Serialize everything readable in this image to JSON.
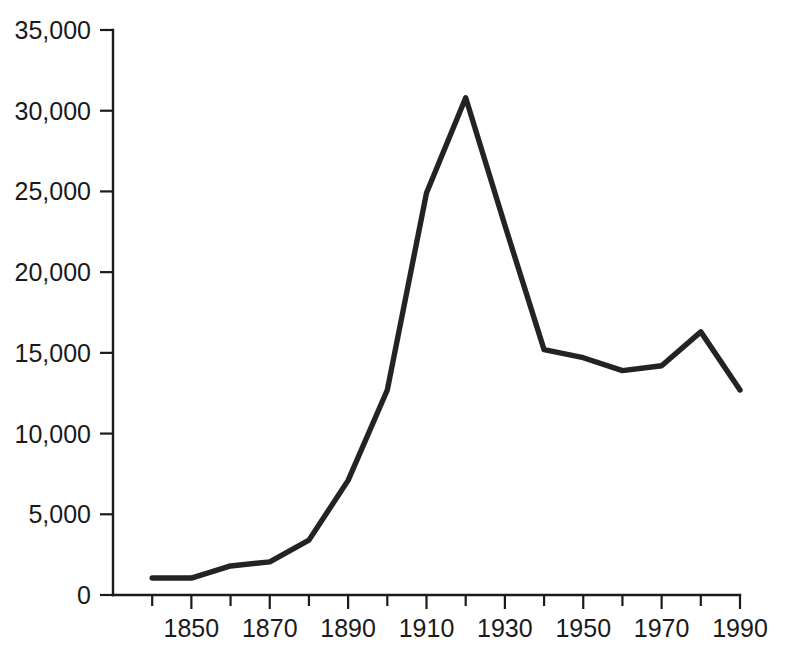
{
  "chart_data": {
    "type": "line",
    "title": "",
    "subtitle": "",
    "xlabel": "",
    "ylabel": "",
    "xlim": [
      1830,
      1990
    ],
    "ylim": [
      0,
      35000
    ],
    "grid": false,
    "legend": null,
    "legend_position": "none",
    "y_ticks": [
      0,
      5000,
      10000,
      15000,
      20000,
      25000,
      30000,
      35000
    ],
    "y_tick_labels": [
      "0",
      "5,000",
      "10,000",
      "15,000",
      "20,000",
      "25,000",
      "30,000",
      "35,000"
    ],
    "x_ticks": [
      1830,
      1840,
      1850,
      1860,
      1870,
      1880,
      1890,
      1900,
      1910,
      1920,
      1930,
      1940,
      1950,
      1960,
      1970,
      1980,
      1990
    ],
    "x_major_ticks": [
      1850,
      1870,
      1890,
      1910,
      1930,
      1950,
      1970,
      1990
    ],
    "x_tick_labels": [
      "1850",
      "1870",
      "1890",
      "1910",
      "1930",
      "1950",
      "1970",
      "1990"
    ],
    "x": [
      1840,
      1850,
      1860,
      1870,
      1880,
      1890,
      1900,
      1910,
      1920,
      1930,
      1940,
      1950,
      1960,
      1970,
      1980,
      1990
    ],
    "values": [
      1050,
      1050,
      1800,
      2050,
      3400,
      7100,
      12700,
      24900,
      30800,
      22900,
      15200,
      14700,
      13900,
      14200,
      16300,
      12700
    ],
    "series": [
      {
        "name": "series-1",
        "color": "#232323",
        "x": [
          1840,
          1850,
          1860,
          1870,
          1880,
          1890,
          1900,
          1910,
          1920,
          1930,
          1940,
          1950,
          1960,
          1970,
          1980,
          1990
        ],
        "values": [
          1050,
          1050,
          1800,
          2050,
          3400,
          7100,
          12700,
          24900,
          30800,
          22900,
          15200,
          14700,
          13900,
          14200,
          16300,
          12700
        ]
      }
    ],
    "annotations": [],
    "line_color": "#232323",
    "axis_color": "#1a1a1a",
    "background_color": "#ffffff"
  }
}
